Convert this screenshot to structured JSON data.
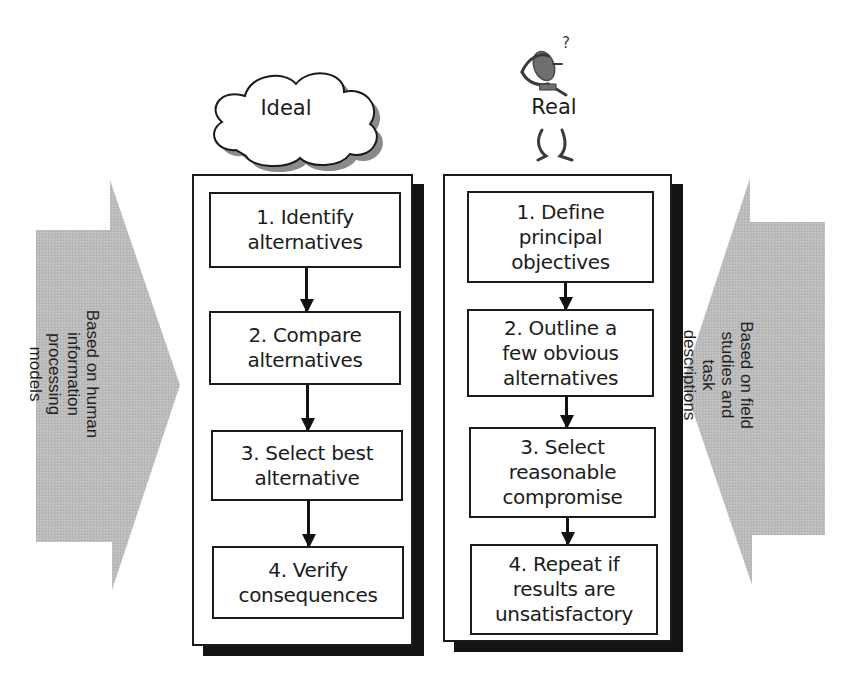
{
  "diagram": {
    "colors": {
      "arrow_fill": "#b9b9b9",
      "stroke": "#1a1a1a",
      "shadow": "#141414",
      "cloud_shadow": "#8a8a8a",
      "figure_head": "#6f6f6f"
    },
    "left_arrow": {
      "direction": "right",
      "lines": [
        "Based on human",
        "information",
        "processing",
        "models"
      ]
    },
    "right_arrow": {
      "direction": "left",
      "lines": [
        "Based on field",
        "studies and",
        "task",
        "descriptions"
      ]
    },
    "ideal": {
      "icon": "cloud-icon",
      "label": "Ideal",
      "steps": [
        {
          "lines": [
            "1. Identify",
            "alternatives"
          ]
        },
        {
          "lines": [
            "2. Compare",
            "alternatives"
          ]
        },
        {
          "lines": [
            "3. Select best",
            "alternative"
          ]
        },
        {
          "lines": [
            "4. Verify",
            "consequences"
          ]
        }
      ]
    },
    "real": {
      "icon": "confused-person-icon",
      "question_mark": "?",
      "label": "Real",
      "steps": [
        {
          "lines": [
            "1. Define",
            "principal",
            "objectives"
          ]
        },
        {
          "lines": [
            "2. Outline a",
            "few obvious",
            "alternatives"
          ]
        },
        {
          "lines": [
            "3. Select",
            "reasonable",
            "compromise"
          ]
        },
        {
          "lines": [
            "4. Repeat if",
            "results are",
            "unsatisfactory"
          ]
        }
      ]
    },
    "caption": {
      "clipped": true
    }
  }
}
